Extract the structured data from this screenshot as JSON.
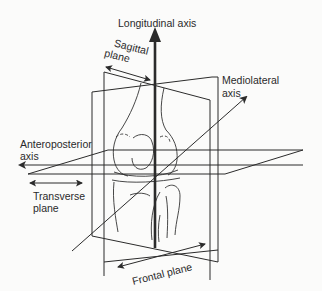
{
  "diagram": {
    "labels": {
      "longitudinal_axis": "Longitudinal axis",
      "sagittal_plane_line1": "Sagittal",
      "sagittal_plane_line2": "plane",
      "mediolateral_axis_line1": "Mediolateral",
      "mediolateral_axis_line2": "axis",
      "anteroposterior_axis_line1": "Anteroposterior",
      "anteroposterior_axis_line2": "axis",
      "transverse_plane_line1": "Transverse",
      "transverse_plane_line2": "plane",
      "frontal_plane": "Frontal plane"
    },
    "axes": [
      {
        "name": "Longitudinal axis",
        "direction": "vertical"
      },
      {
        "name": "Mediolateral axis",
        "direction": "diagonal"
      },
      {
        "name": "Anteroposterior axis",
        "direction": "horizontal"
      }
    ],
    "planes": [
      {
        "name": "Sagittal plane"
      },
      {
        "name": "Frontal plane"
      },
      {
        "name": "Transverse plane"
      }
    ],
    "colors": {
      "line": "#2b2b2b",
      "background": "#fbfbfa",
      "text": "#2a2a2a"
    }
  }
}
